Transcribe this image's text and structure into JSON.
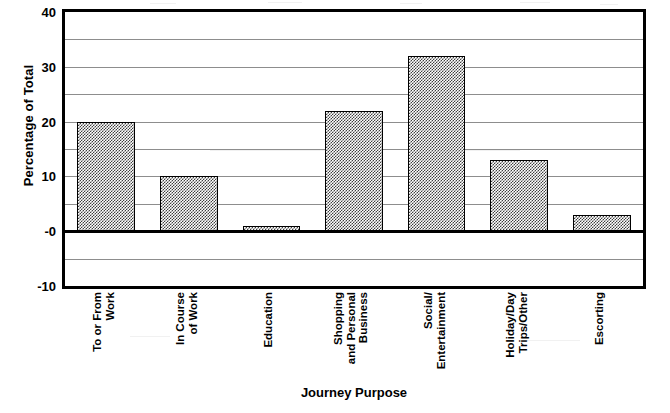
{
  "chart_data": {
    "type": "bar",
    "title": "",
    "xlabel": "Journey Purpose",
    "ylabel": "Percentage of Total",
    "categories": [
      "To or From Work",
      "In Course of Work",
      "Education",
      "Shopping and Personal Business",
      "Social/ Entertainment",
      "Holiday/Day Trips/Other",
      "Escorting"
    ],
    "category_lines": [
      [
        "To or From",
        "Work"
      ],
      [
        "In Course",
        "of Work"
      ],
      [
        "Education"
      ],
      [
        "Shopping",
        "and Personal",
        "Business"
      ],
      [
        "Social/",
        "Entertainment"
      ],
      [
        "Holiday/Day",
        "Trips/Other"
      ],
      [
        "Escorting"
      ]
    ],
    "values": [
      20,
      10,
      1,
      22,
      32,
      13,
      3
    ],
    "ylim": [
      -10,
      40
    ],
    "ytick_labels": [
      "40",
      "30",
      "20",
      "10",
      "-0",
      "-10"
    ],
    "ytick_values": [
      40,
      30,
      20,
      10,
      0,
      -10
    ],
    "gridline_values": [
      35,
      30,
      25,
      20,
      15,
      10,
      5,
      0,
      -5
    ],
    "grid": true,
    "legend": "none",
    "bar_fill": "checkerboard-dither-gray",
    "colors": {
      "axis": "#000000",
      "gridline": "#8d8d8d",
      "bar_fill": "#7f7f7f",
      "bar_outline": "#000000",
      "background": "#ffffff",
      "text": "#000000"
    }
  }
}
